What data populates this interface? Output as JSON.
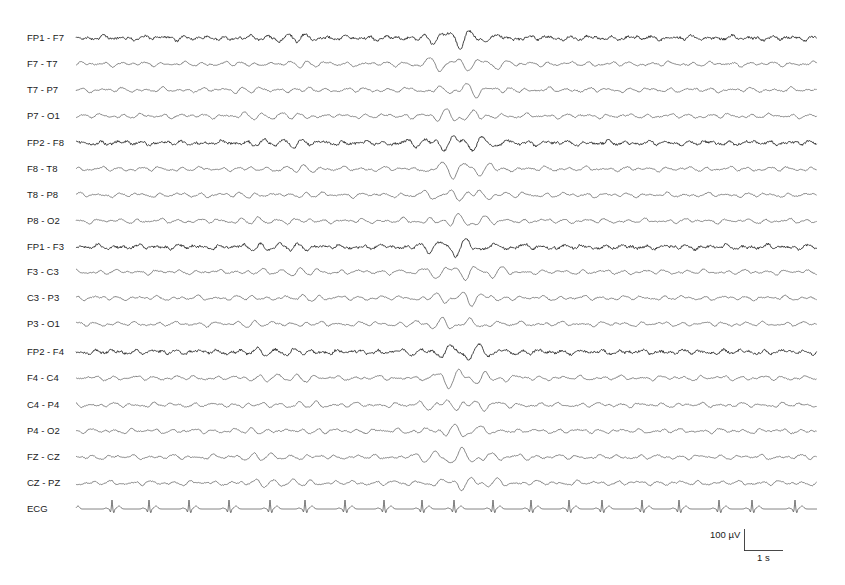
{
  "chart_data": {
    "type": "line",
    "title": "",
    "channels": [
      "FP1 - F7",
      "F7 - T7",
      "T7 - P7",
      "P7 - O1",
      "FP2 - F8",
      "F8 - T8",
      "T8 - P8",
      "P8 - O2",
      "FP1 - F3",
      "F3 - C3",
      "C3 - P3",
      "P3 - O1",
      "FP2 - F4",
      "F4 - C4",
      "C4 - P4",
      "P4 - O2",
      "FZ - CZ",
      "CZ - PZ",
      "ECG"
    ],
    "baselines_px": [
      38,
      64,
      90,
      116,
      143,
      169,
      195,
      221,
      247,
      272,
      298,
      324,
      352,
      378,
      405,
      431,
      457,
      483,
      509
    ],
    "x_range_px": [
      76,
      817
    ],
    "burst_region_px": [
      420,
      500
    ],
    "ecg_r_peaks_px": [
      112,
      149,
      189,
      229,
      270,
      305,
      345,
      384,
      422,
      454,
      493,
      531,
      569,
      602,
      642,
      679,
      719,
      752,
      795
    ],
    "scale_bar": {
      "amplitude": "100 µV",
      "time": "1 s"
    },
    "grid": false,
    "legend": null
  },
  "scale_bar": {
    "amplitude_label": "100 µV",
    "time_label": "1 s"
  },
  "colors": {
    "trace": "#555555",
    "trace_frontal": "#2a2a2a",
    "label": "#1a1a1a"
  }
}
